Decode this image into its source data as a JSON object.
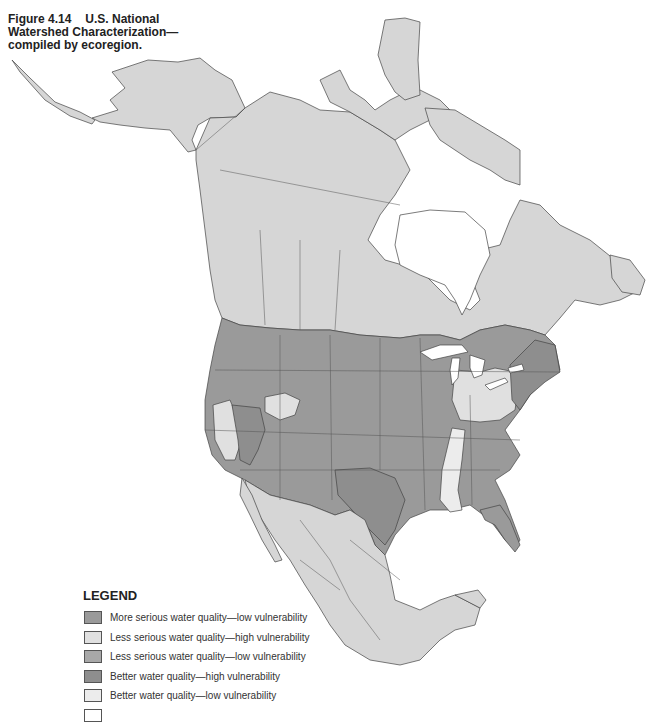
{
  "figure": {
    "number": "Figure 4.14",
    "title_line1": "U.S. National",
    "title_line2": "Watershed Characterization—",
    "title_line3": "compiled by ecoregion."
  },
  "legend": {
    "title": "LEGEND",
    "items": [
      {
        "label": "More serious water quality—low vulnerability",
        "color": "#9a9a9a"
      },
      {
        "label": "Less serious water quality—high vulnerability",
        "color": "#e0e0e0"
      },
      {
        "label": "Less serious water quality—low vulnerability",
        "color": "#a8a8a8"
      },
      {
        "label": "Better water quality—high vulnerability",
        "color": "#8e8e8e"
      },
      {
        "label": "Better water quality—low vulnerability",
        "color": "#ececec"
      },
      {
        "label": "",
        "color": "#ffffff"
      }
    ]
  },
  "map": {
    "land_outside_us_color": "#d6d6d6",
    "water_color": "#ffffff",
    "border_color": "#444444"
  }
}
